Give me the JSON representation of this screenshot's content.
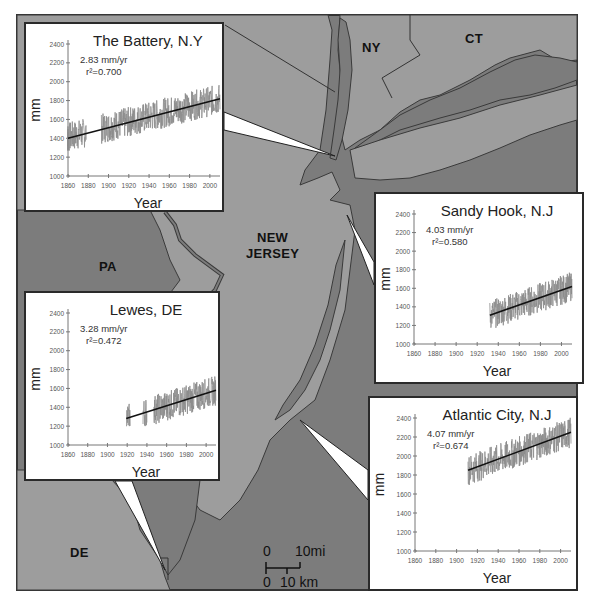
{
  "map": {
    "frame": {
      "x": 17,
      "y": 15,
      "w": 560,
      "h": 575
    },
    "colors": {
      "land": "#9d9d9d",
      "water": "#7c7c7c",
      "outline": "#3a3a3a",
      "border": "#333333",
      "panel_bg": "#ffffff",
      "series": "#8c8c8c",
      "trend": "#111111"
    },
    "region_labels": [
      {
        "id": "NY",
        "text": "NY",
        "x": 362,
        "y": 40
      },
      {
        "id": "CT",
        "text": "CT",
        "x": 465,
        "y": 31
      },
      {
        "id": "NJ",
        "text": "NEW\nJERSEY",
        "x": 248,
        "y": 232
      },
      {
        "id": "PA",
        "text": "PA",
        "x": 99,
        "y": 259
      },
      {
        "id": "DE",
        "text": "DE",
        "x": 70,
        "y": 545
      }
    ],
    "scale_bar": {
      "top_label_0": "0",
      "top_label_end": "10mi",
      "bottom_label_0": "0",
      "bottom_label_end": "10 km"
    }
  },
  "chart_data": [
    {
      "type": "line",
      "title": "The Battery, N.Y",
      "annotation_rate": "2.83 mm/yr",
      "annotation_r2": "r²=0.700",
      "rate_mm_per_yr": 2.83,
      "r_squared": 0.7,
      "xlabel": "Year",
      "ylabel": "mm",
      "xlim": [
        1860,
        2010
      ],
      "ylim": [
        1000,
        2400
      ],
      "xticks": [
        1860,
        1880,
        1900,
        1920,
        1940,
        1960,
        1980,
        2000
      ],
      "yticks": [
        1000,
        1200,
        1400,
        1600,
        1800,
        2000,
        2200,
        2400
      ],
      "data_range_years": [
        [
          1856,
          1878
        ],
        [
          1893,
          2010
        ]
      ],
      "trend_line": {
        "x": [
          1856,
          2010
        ],
        "y": [
          1400,
          1820
        ]
      },
      "series_envelope": {
        "low": 1250,
        "high": 2000
      },
      "grid": false
    },
    {
      "type": "line",
      "title": "Sandy Hook, N.J",
      "annotation_rate": "4.03 mm/yr",
      "annotation_r2": "r²=0.580",
      "rate_mm_per_yr": 4.03,
      "r_squared": 0.58,
      "xlabel": "Year",
      "ylabel": "mm",
      "xlim": [
        1860,
        2010
      ],
      "ylim": [
        1000,
        2400
      ],
      "xticks": [
        1860,
        1880,
        1900,
        1920,
        1940,
        1960,
        1980,
        2000
      ],
      "yticks": [
        1000,
        1200,
        1400,
        1600,
        1800,
        2000,
        2200,
        2400
      ],
      "data_range_years": [
        [
          1932,
          2010
        ]
      ],
      "trend_line": {
        "x": [
          1932,
          2010
        ],
        "y": [
          1310,
          1620
        ]
      },
      "series_envelope": {
        "low": 1100,
        "high": 1800
      },
      "grid": false
    },
    {
      "type": "line",
      "title": "Lewes, DE",
      "annotation_rate": "3.28 mm/yr",
      "annotation_r2": "r²=0.472",
      "rate_mm_per_yr": 3.28,
      "r_squared": 0.472,
      "xlabel": "Year",
      "ylabel": "mm",
      "xlim": [
        1860,
        2010
      ],
      "ylim": [
        1000,
        2400
      ],
      "xticks": [
        1860,
        1880,
        1900,
        1920,
        1940,
        1960,
        1980,
        2000
      ],
      "yticks": [
        1000,
        1200,
        1400,
        1600,
        1800,
        2000,
        2200,
        2400
      ],
      "data_range_years": [
        [
          1919,
          1923
        ],
        [
          1936,
          1940
        ],
        [
          1947,
          2010
        ]
      ],
      "trend_line": {
        "x": [
          1919,
          2010
        ],
        "y": [
          1280,
          1580
        ]
      },
      "series_envelope": {
        "low": 1200,
        "high": 1790
      },
      "grid": false
    },
    {
      "type": "line",
      "title": "Atlantic City, N.J",
      "annotation_rate": "4.07 mm/yr",
      "annotation_r2": "r²=0.674",
      "rate_mm_per_yr": 4.07,
      "r_squared": 0.674,
      "xlabel": "Year",
      "ylabel": "mm",
      "xlim": [
        1860,
        2010
      ],
      "ylim": [
        1000,
        2400
      ],
      "xticks": [
        1860,
        1880,
        1900,
        1920,
        1940,
        1960,
        1980,
        2000
      ],
      "yticks": [
        1000,
        1200,
        1400,
        1600,
        1800,
        2000,
        2200,
        2400
      ],
      "data_range_years": [
        [
          1911,
          2010
        ]
      ],
      "trend_line": {
        "x": [
          1911,
          2010
        ],
        "y": [
          1850,
          2250
        ]
      },
      "series_envelope": {
        "low": 1680,
        "high": 2420
      },
      "grid": false
    }
  ],
  "panels": [
    {
      "id": "battery",
      "x": 24,
      "y": 22,
      "w": 200,
      "h": 190,
      "plot": {
        "x": 42,
        "y": 20,
        "w": 152,
        "h": 132
      },
      "callout": [
        [
          224,
          130
        ],
        [
          224,
          112
        ],
        [
          335,
          156
        ]
      ]
    },
    {
      "id": "sandyhook",
      "x": 374,
      "y": 192,
      "w": 210,
      "h": 192,
      "plot": {
        "x": 38,
        "y": 20,
        "w": 158,
        "h": 130
      },
      "callout": [
        [
          374,
          262
        ],
        [
          374,
          285
        ],
        [
          347,
          215
        ]
      ]
    },
    {
      "id": "lewes",
      "x": 24,
      "y": 291,
      "w": 196,
      "h": 190,
      "plot": {
        "x": 42,
        "y": 20,
        "w": 148,
        "h": 132
      },
      "callout": [
        [
          115,
          481
        ],
        [
          132,
          481
        ],
        [
          165,
          570
        ]
      ]
    },
    {
      "id": "atlantic",
      "x": 368,
      "y": 396,
      "w": 210,
      "h": 195,
      "plot": {
        "x": 45,
        "y": 20,
        "w": 156,
        "h": 133
      },
      "callout": [
        [
          368,
          470
        ],
        [
          368,
          500
        ],
        [
          300,
          420
        ]
      ]
    }
  ]
}
